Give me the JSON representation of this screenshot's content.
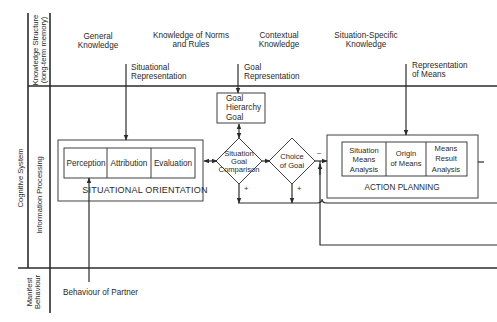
{
  "axis_labels": {
    "cognitive_system": "Cognitive System",
    "knowledge_structure_line1": "Knowledge Structure",
    "knowledge_structure_line2": "(long-term memory)",
    "information_processing": "Information Processing",
    "manifest_behaviour_line1": "Manifest",
    "manifest_behaviour_line2": "Behaviour"
  },
  "knowledge": {
    "general": [
      "General",
      "Knowledge"
    ],
    "norms": [
      "Knowledge of Norms",
      "and Rules"
    ],
    "contextual": [
      "Contextual",
      "Knowledge"
    ],
    "situation_specific": [
      "Situation-Specific",
      "Knowledge"
    ]
  },
  "representations": {
    "situational": [
      "Situational",
      "Representation"
    ],
    "goal": [
      "Goal",
      "Representation"
    ],
    "means": [
      "Representation",
      "of Means"
    ]
  },
  "goal_hierarchy": {
    "line1": "Goal",
    "line2": "Hierarchy",
    "line3": "Goal"
  },
  "situational_orientation": {
    "title": "SITUATIONAL ORIENTATION",
    "cells": [
      "Perception",
      "Attribution",
      "Evaluation"
    ]
  },
  "decisions": {
    "comparison": [
      "Situation",
      "Goal",
      "Comparison"
    ],
    "choice": [
      "Choice",
      "of Goal"
    ],
    "plus": "+",
    "minus": "–"
  },
  "action_planning": {
    "title": "ACTION PLANNING",
    "cells": [
      [
        "Situation",
        "Means",
        "Analysis"
      ],
      [
        "Origin",
        "of Means"
      ],
      [
        "Means",
        "Result",
        "Analysis"
      ]
    ]
  },
  "behaviour_of_partner": "Behaviour of Partner"
}
